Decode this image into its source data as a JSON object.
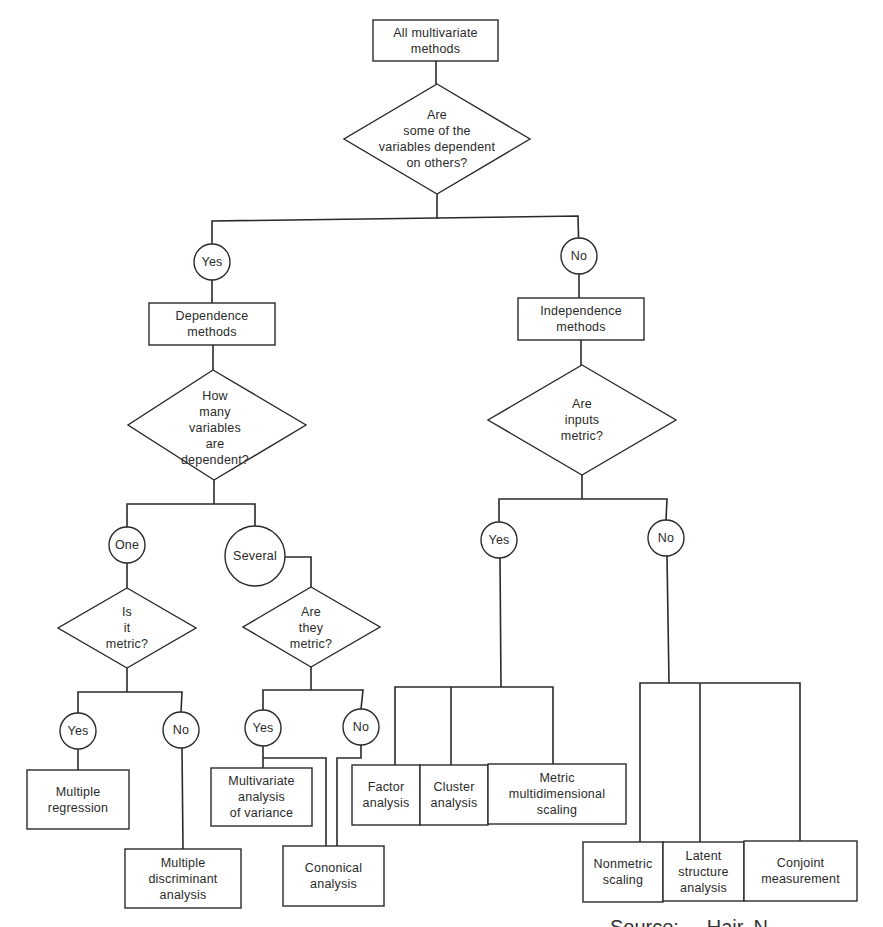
{
  "diagram": {
    "title": "All multivariate methods",
    "colors": {
      "line": "#2a2a2a",
      "background": "#ffffff"
    },
    "nodes": {
      "root": {
        "type": "box",
        "lines": [
          "All multivariate",
          "methods"
        ]
      },
      "q_dependent": {
        "type": "decision",
        "lines": [
          "Are",
          "some of the",
          "variables dependent",
          "on others?"
        ]
      },
      "yes_dep": {
        "type": "answer",
        "lines": [
          "Yes"
        ]
      },
      "no_dep": {
        "type": "answer",
        "lines": [
          "No"
        ]
      },
      "dependence_methods": {
        "type": "box",
        "lines": [
          "Dependence",
          "methods"
        ]
      },
      "independence_methods": {
        "type": "box",
        "lines": [
          "Independence",
          "methods"
        ]
      },
      "q_how_many": {
        "type": "decision",
        "lines": [
          "How",
          "many",
          "variables",
          "are",
          "dependent?"
        ]
      },
      "q_inputs_metric": {
        "type": "decision",
        "lines": [
          "Are",
          "inputs",
          "metric?"
        ]
      },
      "one": {
        "type": "answer",
        "lines": [
          "One"
        ]
      },
      "several": {
        "type": "answer",
        "lines": [
          "Several"
        ]
      },
      "q_is_it_metric": {
        "type": "decision",
        "lines": [
          "Is",
          "it",
          "metric?"
        ]
      },
      "q_are_they_metric": {
        "type": "decision",
        "lines": [
          "Are",
          "they",
          "metric?"
        ]
      },
      "one_yes": {
        "type": "answer",
        "lines": [
          "Yes"
        ]
      },
      "one_no": {
        "type": "answer",
        "lines": [
          "No"
        ]
      },
      "several_yes": {
        "type": "answer",
        "lines": [
          "Yes"
        ]
      },
      "several_no": {
        "type": "answer",
        "lines": [
          "No"
        ]
      },
      "inputs_yes": {
        "type": "answer",
        "lines": [
          "Yes"
        ]
      },
      "inputs_no": {
        "type": "answer",
        "lines": [
          "No"
        ]
      },
      "multiple_regression": {
        "type": "box",
        "lines": [
          "Multiple",
          "regression"
        ]
      },
      "multiple_discriminant": {
        "type": "box",
        "lines": [
          "Multiple",
          "discriminant",
          "analysis"
        ]
      },
      "manova": {
        "type": "box",
        "lines": [
          "Multivariate",
          "analysis",
          "of variance"
        ]
      },
      "canonical": {
        "type": "box",
        "lines": [
          "Cononical",
          "analysis"
        ]
      },
      "factor": {
        "type": "box",
        "lines": [
          "Factor",
          "analysis"
        ]
      },
      "cluster": {
        "type": "box",
        "lines": [
          "Cluster",
          "analysis"
        ]
      },
      "metric_mds": {
        "type": "box",
        "lines": [
          "Metric",
          "multidimensional",
          "scaling"
        ]
      },
      "nonmetric": {
        "type": "box",
        "lines": [
          "Nonmetric",
          "scaling"
        ]
      },
      "latent": {
        "type": "box",
        "lines": [
          "Latent",
          "structure",
          "analysis"
        ]
      },
      "conjoint": {
        "type": "box",
        "lines": [
          "Conjoint",
          "measurement"
        ]
      }
    },
    "footer_clipped_text": "Source: ... Hair, N..."
  }
}
